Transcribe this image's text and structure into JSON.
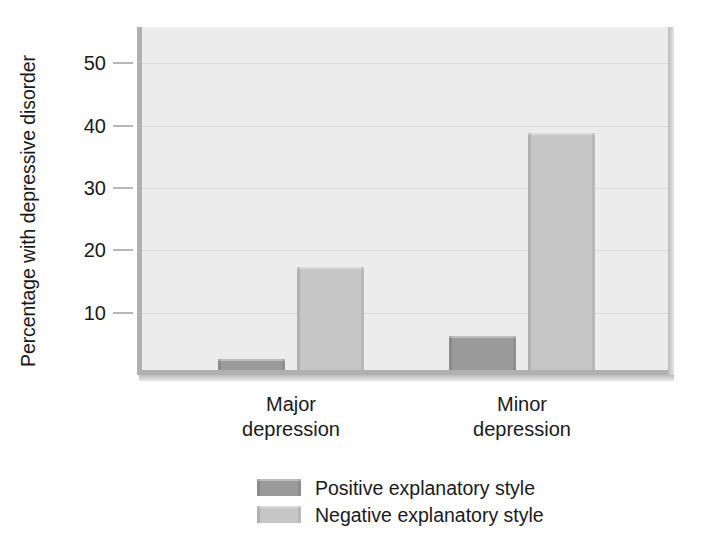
{
  "chart_data": {
    "type": "bar",
    "title": "",
    "subtitle": "",
    "xlabel": "",
    "ylabel": "Percentage with depressive disorder",
    "categories": [
      "Major depression",
      "Minor depression"
    ],
    "category_lines": [
      [
        "Major",
        "depression"
      ],
      [
        "Minor",
        "depression"
      ]
    ],
    "series": [
      {
        "name": "Positive explanatory style",
        "color": "#9a9a9a",
        "values": [
          1.8,
          5.5
        ]
      },
      {
        "name": "Negative explanatory style",
        "color": "#c6c6c6",
        "values": [
          16.5,
          38.0
        ]
      }
    ],
    "ylim": [
      0,
      55.8
    ],
    "yticks": [
      10,
      20,
      30,
      40,
      50
    ],
    "ytick_labels": [
      "10",
      "20",
      "30",
      "40",
      "50"
    ],
    "grid": true,
    "grid_color": "#dcdcdc",
    "legend_position": "bottom-center",
    "plot_background": "#ececec",
    "axis_color": "#b0b0b0"
  },
  "axis": {
    "y_title": "Percentage with depressive disorder"
  },
  "legend": {
    "items": [
      {
        "label": "Positive explanatory style",
        "color": "#9a9a9a"
      },
      {
        "label": "Negative explanatory style",
        "color": "#c6c6c6"
      }
    ]
  }
}
